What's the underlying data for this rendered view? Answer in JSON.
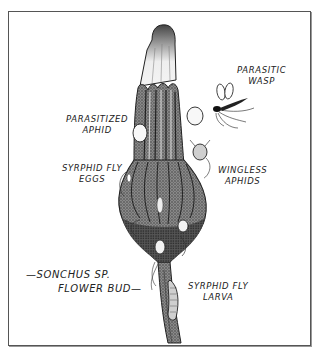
{
  "figure": {
    "labels": {
      "parasitic_wasp": [
        "PARASITIC",
        "WASP"
      ],
      "parasitized_aphid": [
        "PARASITIZED",
        "APHID"
      ],
      "syrphid_fly_eggs": [
        "SYRPHID FLY",
        "EGGS"
      ],
      "wingless_aphids": [
        "WINGLESS",
        "APHIDS"
      ],
      "sonchus_title": [
        "—SONCHUS  SP.",
        "FLOWER BUD—"
      ],
      "syrphid_fly_larva": [
        "SYRPHID FLY",
        "LARVA"
      ]
    },
    "colors": {
      "ink": "#222222",
      "frame": "#555555",
      "bud_dark": "#3a3a3a",
      "bud_mid": "#7a7a7a",
      "bud_light": "#e8e8e8",
      "background": "#ffffff"
    }
  }
}
